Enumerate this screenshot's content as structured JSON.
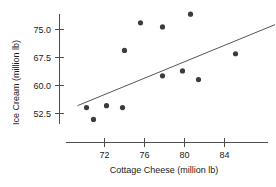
{
  "chart_data": {
    "type": "scatter",
    "title": "",
    "xlabel": "Cottage Cheese (million lb)",
    "ylabel": "Ice Cream (million lb)",
    "xlim": [
      69.2,
      86.5
    ],
    "ylim": [
      48.5,
      79.5
    ],
    "xticks": [
      72,
      76,
      80,
      84
    ],
    "xticklabels": [
      "72",
      "76",
      "80",
      "84"
    ],
    "yticks": [
      52.5,
      60.0,
      67.5,
      75.0
    ],
    "yticklabels": [
      "52.5",
      "60.0",
      "67.5",
      "75.0"
    ],
    "grid": false,
    "legend": null,
    "points": [
      {
        "x": 70.2,
        "y": 54.1
      },
      {
        "x": 70.9,
        "y": 50.9
      },
      {
        "x": 72.2,
        "y": 54.6
      },
      {
        "x": 73.8,
        "y": 54.1
      },
      {
        "x": 74.0,
        "y": 69.4
      },
      {
        "x": 75.6,
        "y": 76.8
      },
      {
        "x": 77.8,
        "y": 75.7
      },
      {
        "x": 77.8,
        "y": 62.6
      },
      {
        "x": 79.8,
        "y": 63.9
      },
      {
        "x": 80.6,
        "y": 79.1
      },
      {
        "x": 81.4,
        "y": 61.6
      },
      {
        "x": 85.1,
        "y": 68.5
      }
    ],
    "trend_line": {
      "type": "linear-fit",
      "x_start": 69.3,
      "y_start": 54.6,
      "x_end": 89.5,
      "y_end": 76.8
    },
    "marker": {
      "shape": "circle",
      "radius_px": 2.6,
      "color": "#3c3c3c"
    },
    "line_color": "#555555",
    "axis_color": "#4d4d4d",
    "text_color": "#1a1a1a",
    "background": "#ffffff"
  }
}
